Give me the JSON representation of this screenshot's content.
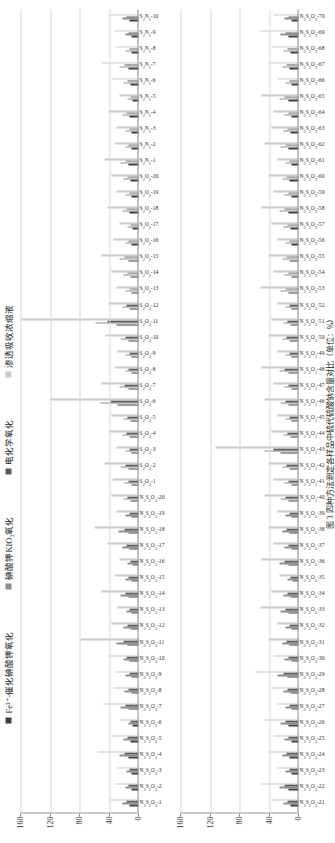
{
  "figure": {
    "caption": "图 3  四种方法测定各样品中硫代硫酸钠含量对比（单位：%）",
    "legend": [
      {
        "label": "Fe³⁺-催化碘酸钾氧化",
        "color": "#3f3f3f"
      },
      {
        "label": "碘酸钾KIO₃氧化",
        "color": "#8e8e8e"
      },
      {
        "label": "电化学氧化",
        "color": "#5d5d5d"
      },
      {
        "label": "渗透吸收浓缩液",
        "color": "#c9c9c9"
      }
    ],
    "axis": {
      "ticks": [
        0,
        40,
        80,
        120,
        160
      ],
      "ymin": 0,
      "ymax": 160,
      "gridlines": true
    },
    "panels": [
      "panel-top",
      "panel-bottom"
    ]
  },
  "chart_data": [
    {
      "type": "bar",
      "orientation": "horizontal-rotated",
      "title": "",
      "xlabel": "",
      "ylabel": "",
      "ylim": [
        0,
        160
      ],
      "yticks": [
        0,
        40,
        80,
        120,
        160
      ],
      "categories": [
        "N₂S₂O₃-1",
        "N₂S₂O₃-2",
        "N₂S₂O₃-3",
        "N₂S₂O₃-4",
        "N₂S₂O₃-5",
        "N₂S₂O₃-6",
        "N₂S₂O₃-7",
        "N₂S₂O₃-8",
        "N₂S₂O₃-9",
        "N₂S₂O₃-10",
        "N₂S₂O₃-11",
        "N₂S₂O₃-12",
        "N₂S₂O₃-13",
        "N₂S₂O₃-14",
        "N₂S₂O₃-15",
        "N₂S₂O₃-16",
        "N₂S₂O₃-17",
        "N₂S₂O₃-18",
        "N₂S₂O₃-19",
        "N₂S₂O₃-20",
        "S₂O₃-1",
        "S₂O₃-2",
        "S₂O₃-3",
        "S₂O₃-4",
        "S₂O₃-5",
        "S₂O₃-6",
        "S₂O₃-7",
        "S₂O₃-8",
        "S₂O₃-9",
        "S₂O₃-10",
        "S₂O₃-11",
        "S₂O₃-12",
        "S₂O₃-13",
        "S₂O₃-14",
        "S₂O₃-15",
        "S₂O₃-16",
        "S₂O₃-17",
        "S₂O₃-18",
        "S₂O₃-19",
        "S₂O₃-20",
        "S₂N₂-1",
        "S₂N₂-2",
        "S₂N₂-3",
        "S₂N₂-4",
        "S₂N₂-5",
        "S₂N₂-6",
        "S₂N₂-7",
        "S₂N₂-8",
        "S₂N₂-9",
        "S₂N₂-10"
      ],
      "series": [
        {
          "name": "Fe³⁺-催化碘酸钾氧化",
          "color": "#3f3f3f",
          "values": [
            12,
            10,
            9,
            14,
            11,
            8,
            13,
            10,
            9,
            12,
            15,
            11,
            9,
            13,
            10,
            8,
            12,
            14,
            9,
            11,
            10,
            13,
            9,
            12,
            11,
            28,
            14,
            10,
            9,
            13,
            30,
            12,
            9,
            11,
            14,
            10,
            8,
            12,
            9,
            11,
            13,
            10,
            9,
            12,
            8,
            11,
            14,
            9,
            10,
            12
          ]
        },
        {
          "name": "碘酸钾KIO₃氧化",
          "color": "#8e8e8e",
          "values": [
            22,
            18,
            16,
            26,
            20,
            14,
            24,
            19,
            17,
            21,
            30,
            20,
            16,
            25,
            18,
            15,
            22,
            27,
            17,
            20,
            19,
            24,
            17,
            22,
            20,
            52,
            26,
            18,
            17,
            24,
            58,
            22,
            17,
            20,
            26,
            18,
            15,
            22,
            17,
            20,
            24,
            18,
            17,
            22,
            15,
            20,
            26,
            17,
            18,
            22
          ]
        },
        {
          "name": "电化学氧化",
          "color": "#5d5d5d",
          "values": [
            16,
            13,
            12,
            19,
            15,
            11,
            17,
            14,
            12,
            16,
            21,
            15,
            12,
            18,
            13,
            11,
            16,
            19,
            12,
            15,
            14,
            17,
            12,
            16,
            15,
            38,
            19,
            13,
            12,
            17,
            42,
            16,
            12,
            15,
            19,
            13,
            11,
            16,
            12,
            15,
            17,
            13,
            12,
            16,
            11,
            15,
            19,
            12,
            13,
            16
          ]
        },
        {
          "name": "渗透吸收浓缩液",
          "color": "#c9c9c9",
          "values": [
            40,
            33,
            28,
            55,
            37,
            24,
            47,
            34,
            30,
            41,
            78,
            36,
            29,
            50,
            33,
            26,
            42,
            60,
            30,
            37,
            35,
            46,
            30,
            40,
            36,
            120,
            50,
            33,
            29,
            45,
            158,
            41,
            30,
            37,
            50,
            34,
            26,
            42,
            30,
            37,
            46,
            33,
            30,
            41,
            26,
            37,
            50,
            30,
            33,
            41
          ]
        }
      ]
    },
    {
      "type": "bar",
      "orientation": "horizontal-rotated",
      "title": "",
      "xlabel": "",
      "ylabel": "",
      "ylim": [
        0,
        160
      ],
      "yticks": [
        0,
        40,
        80,
        120,
        160
      ],
      "categories": [
        "N₂S₂O₃-21",
        "N₂S₂O₃-22",
        "N₂S₂O₃-23",
        "N₂S₂O₃-24",
        "N₂S₂O₃-25",
        "N₂S₂O₃-26",
        "N₂S₂O₃-27",
        "N₂S₂O₃-28",
        "N₂S₂O₃-29",
        "N₂S₂O₃-30",
        "N₂S₂O₃-31",
        "N₂S₂O₃-32",
        "N₂S₂O₃-33",
        "N₂S₂O₃-34",
        "N₂S₂O₃-35",
        "N₂S₂O₃-36",
        "N₂S₂O₃-37",
        "N₂S₂O₃-38",
        "N₂S₂O₃-39",
        "N₂S₂O₃-40",
        "N₂S₂O₃-41",
        "N₂S₂O₃-42",
        "N₂S₂O₃-43",
        "N₂S₂O₃-44",
        "N₂S₂O₃-45",
        "N₂S₂O₃-46",
        "N₂S₂O₃-47",
        "N₂S₂O₃-48",
        "N₂S₂O₃-49",
        "N₂S₂O₃-50",
        "N₂S₂O₃-51",
        "N₂S₂O₃-52",
        "N₂S₂O₃-53",
        "N₂S₂O₃-54",
        "N₂S₂O₃-55",
        "N₂S₂O₃-56",
        "N₂S₂O₃-57",
        "N₂S₂O₃-58",
        "N₂S₂O₃-59",
        "N₂S₂O₃-60",
        "N₂S₂O₃-61",
        "N₂S₂O₃-62",
        "N₂S₂O₃-63",
        "N₂S₂O₃-64",
        "N₂S₂O₃-65",
        "N₂S₂O₃-66",
        "N₂S₂O₃-67",
        "N₂S₂O₃-68",
        "N₂S₂O₃-69",
        "N₂S₂O₃-70"
      ],
      "series": [
        {
          "name": "Fe³⁺-催化碘酸钾氧化",
          "color": "#3f3f3f",
          "values": [
            11,
            14,
            9,
            12,
            10,
            13,
            9,
            11,
            15,
            10,
            12,
            9,
            13,
            11,
            8,
            14,
            10,
            12,
            9,
            13,
            10,
            12,
            24,
            11,
            9,
            13,
            10,
            14,
            9,
            12,
            11,
            9,
            13,
            10,
            12,
            9,
            11,
            14,
            10,
            12,
            9,
            13,
            11,
            10,
            14,
            9,
            12,
            11,
            13,
            10
          ]
        },
        {
          "name": "碘酸钾KIO₃氧化",
          "color": "#8e8e8e",
          "values": [
            20,
            26,
            17,
            22,
            19,
            24,
            17,
            20,
            28,
            19,
            22,
            17,
            25,
            20,
            15,
            26,
            19,
            22,
            17,
            24,
            19,
            22,
            46,
            20,
            17,
            24,
            19,
            26,
            17,
            22,
            20,
            17,
            25,
            19,
            22,
            17,
            20,
            26,
            19,
            22,
            17,
            24,
            20,
            19,
            26,
            17,
            22,
            20,
            25,
            19
          ]
        },
        {
          "name": "电化学氧化",
          "color": "#5d5d5d",
          "values": [
            15,
            19,
            12,
            16,
            14,
            17,
            12,
            15,
            21,
            14,
            16,
            12,
            18,
            15,
            11,
            19,
            14,
            16,
            12,
            17,
            14,
            16,
            34,
            15,
            12,
            17,
            14,
            19,
            12,
            16,
            15,
            12,
            18,
            14,
            16,
            12,
            15,
            19,
            14,
            16,
            12,
            17,
            15,
            14,
            19,
            12,
            16,
            15,
            18,
            14
          ]
        },
        {
          "name": "渗透吸收浓缩液",
          "color": "#c9c9c9",
          "values": [
            37,
            50,
            29,
            41,
            34,
            46,
            29,
            37,
            58,
            34,
            41,
            29,
            52,
            37,
            26,
            50,
            34,
            41,
            29,
            46,
            34,
            41,
            112,
            37,
            29,
            46,
            34,
            50,
            29,
            41,
            37,
            29,
            52,
            34,
            41,
            29,
            37,
            50,
            34,
            41,
            29,
            46,
            37,
            34,
            50,
            29,
            41,
            37,
            52,
            34
          ]
        }
      ]
    }
  ]
}
